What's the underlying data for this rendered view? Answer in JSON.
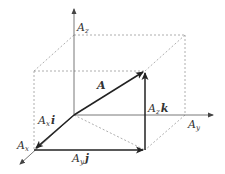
{
  "diagram": {
    "labels": {
      "a": "A",
      "az_main": "A",
      "az_sub": "z",
      "ay_main": "A",
      "ay_sub": "y",
      "ax_main": "A",
      "ax_sub": "x",
      "axi_main": "A",
      "axi_sub": "x",
      "axi_unit": "i",
      "ayj_main": "A",
      "ayj_sub": "y",
      "ayj_unit": "j",
      "azk_main": "A",
      "azk_sub": "z",
      "azk_unit": "k"
    },
    "colors": {
      "vector": "#222222",
      "axis": "#555555",
      "dashed": "#999999"
    }
  }
}
